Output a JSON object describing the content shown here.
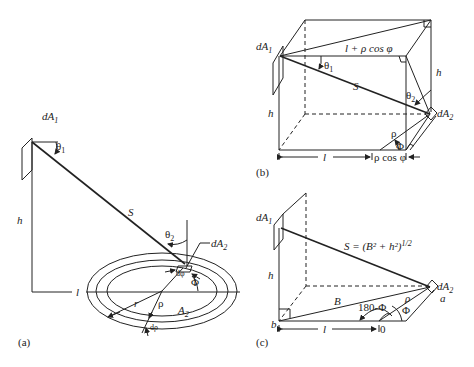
{
  "figure": {
    "panels": [
      {
        "id": "a",
        "caption": "(a)",
        "labels": {
          "dA1": "dA",
          "dA1_sub": "1",
          "theta1": "θ",
          "theta1_sub": "1",
          "h": "h",
          "S": "S",
          "theta2": "θ",
          "theta2_sub": "2",
          "dA2": "dA",
          "dA2_sub": "2",
          "l": "l",
          "dphi": "dφ",
          "phi": "Φ",
          "r": "r",
          "rho": "ρ",
          "A2": "A",
          "A2_sub": "2",
          "drho": "dρ"
        }
      },
      {
        "id": "b",
        "caption": "(b)",
        "labels": {
          "dA1": "dA",
          "dA1_sub": "1",
          "top_edge": "l + ρ cos φ",
          "theta1": "θ",
          "theta1_sub": "1",
          "S": "S",
          "h_left": "h",
          "h_right": "h",
          "theta2": "θ",
          "theta2_sub": "2",
          "dA2": "dA",
          "dA2_sub": "2",
          "rho": "ρ",
          "phi": "Φ",
          "l": "l",
          "rho_cos_phi": "ρ cos φ"
        }
      },
      {
        "id": "c",
        "caption": "(c)",
        "labels": {
          "dA1": "dA",
          "dA1_sub": "1",
          "S_eq": "S = (B² + h²)",
          "S_eq_exp": "1/2",
          "h": "h",
          "B": "B",
          "angle": "180-Φ",
          "rho": "ρ",
          "phi": "Φ",
          "dA2": "dA",
          "dA2_sub": "2",
          "a": "a",
          "b": "b",
          "l": "l",
          "origin": "0"
        }
      }
    ]
  }
}
